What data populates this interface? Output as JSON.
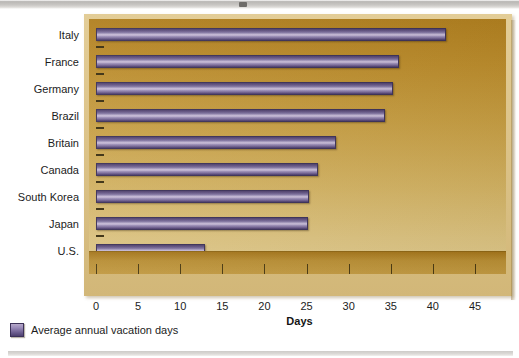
{
  "chart_data": {
    "type": "bar",
    "orientation": "horizontal",
    "title": "",
    "xlabel": "Days",
    "ylabel": "",
    "xlim": [
      0,
      45
    ],
    "xticks": [
      0,
      5,
      10,
      15,
      20,
      25,
      30,
      35,
      40,
      45
    ],
    "grid": false,
    "legend_position": "below-left",
    "categories": [
      "Italy",
      "France",
      "Germany",
      "Brazil",
      "Britain",
      "Canada",
      "South Korea",
      "Japan",
      "U.S."
    ],
    "values": [
      41.5,
      36,
      35.3,
      34.3,
      28.5,
      26.3,
      25.3,
      25.2,
      13
    ],
    "series": [
      {
        "name": "Average annual vacation days",
        "values": [
          41.5,
          36,
          35.3,
          34.3,
          28.5,
          26.3,
          25.3,
          25.2,
          13
        ]
      }
    ]
  },
  "legend": {
    "items": [
      {
        "label": "Average annual vacation days",
        "color": "#6d5e90"
      }
    ]
  },
  "axis": {
    "x_title": "Days",
    "tick_labels": [
      "0",
      "5",
      "10",
      "15",
      "20",
      "25",
      "30",
      "35",
      "40",
      "45"
    ]
  },
  "colors": {
    "bar_fill": "#6d5e90",
    "bar_highlight": "#cfc2dc",
    "bar_border": "#3c3158",
    "plot_bg_top": "#b07f1f",
    "plot_bg_bottom": "#e0cb90",
    "frame": "#dcc389",
    "text": "#1c1c1c"
  }
}
